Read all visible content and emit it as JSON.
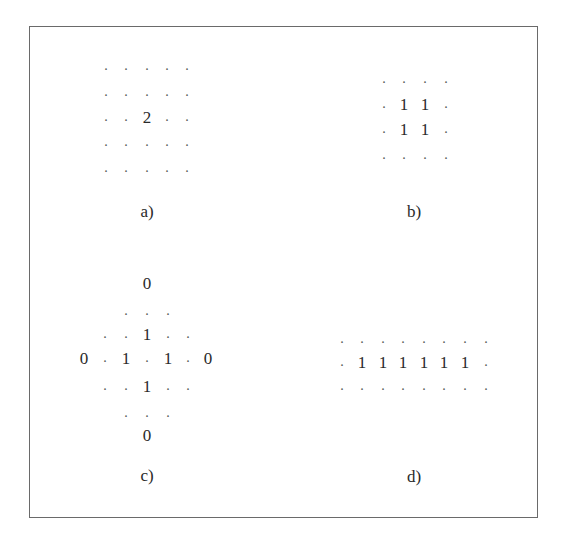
{
  "figure": {
    "border_color": "#6a6a6a",
    "panels": [
      {
        "id": "a",
        "label": "a)",
        "label_pos": [
          147,
          211
        ],
        "columns_x": [
          106,
          126,
          147,
          167,
          187
        ],
        "rows_y": [
          66,
          92,
          117,
          142,
          168
        ],
        "grid": [
          [
            ".",
            ".",
            ".",
            ".",
            "."
          ],
          [
            ".",
            ".",
            ".",
            ".",
            "."
          ],
          [
            ".",
            ".",
            "2",
            ".",
            "."
          ],
          [
            ".",
            ".",
            ".",
            ".",
            "."
          ],
          [
            ".",
            ".",
            ".",
            ".",
            "."
          ]
        ]
      },
      {
        "id": "b",
        "label": "b)",
        "label_pos": [
          414,
          211
        ],
        "columns_x": [
          384,
          404,
          425,
          446
        ],
        "rows_y": [
          79,
          104,
          129,
          155
        ],
        "grid": [
          [
            ".",
            ".",
            ".",
            "."
          ],
          [
            ".",
            "1",
            "1",
            "."
          ],
          [
            ".",
            "1",
            "1",
            "."
          ],
          [
            ".",
            ".",
            ".",
            "."
          ]
        ]
      },
      {
        "id": "c",
        "label": "c)",
        "label_pos": [
          147,
          475
        ],
        "columns_x": [
          84,
          105,
          126,
          147,
          168,
          188,
          208
        ],
        "rows_y": [
          283,
          311,
          334,
          358,
          386,
          413,
          435
        ],
        "grid": [
          [
            "",
            "",
            "",
            "0",
            "",
            "",
            ""
          ],
          [
            "",
            "",
            ".",
            ".",
            ".",
            "",
            ""
          ],
          [
            "",
            ".",
            ".",
            "1",
            ".",
            ".",
            ""
          ],
          [
            "0",
            ".",
            "1",
            ".",
            "1",
            ".",
            "0"
          ],
          [
            "",
            ".",
            ".",
            "1",
            ".",
            ".",
            ""
          ],
          [
            "",
            "",
            ".",
            ".",
            ".",
            "",
            ""
          ],
          [
            "",
            "",
            "",
            "0",
            "",
            "",
            ""
          ]
        ]
      },
      {
        "id": "d",
        "label": "d)",
        "label_pos": [
          414,
          476
        ],
        "columns_x": [
          342,
          362,
          383,
          403,
          424,
          444,
          465,
          486
        ],
        "rows_y": [
          339,
          362,
          386
        ],
        "grid": [
          [
            ".",
            ".",
            ".",
            ".",
            ".",
            ".",
            ".",
            "."
          ],
          [
            ".",
            "1",
            "1",
            "1",
            "1",
            "1",
            "1",
            "."
          ],
          [
            ".",
            ".",
            ".",
            ".",
            ".",
            ".",
            ".",
            "."
          ]
        ]
      }
    ]
  }
}
